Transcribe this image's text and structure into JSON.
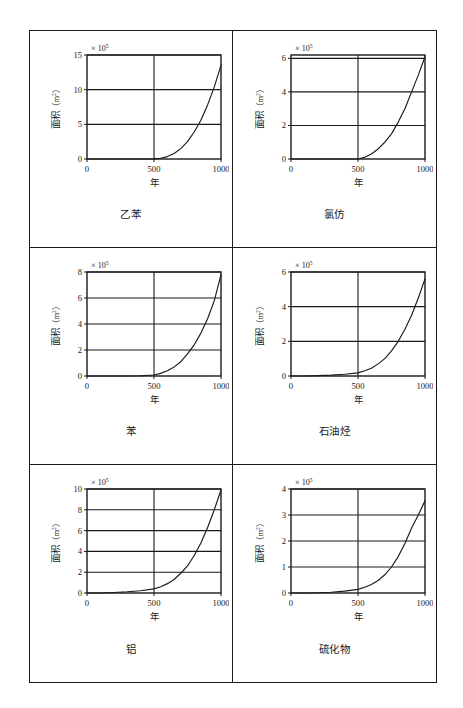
{
  "figure": {
    "layout": {
      "columns": 2,
      "rows": 3
    },
    "shared": {
      "x_axis_label": "年",
      "y_axis_label": "面积",
      "y_axis_unit_open": "（m",
      "y_axis_unit_sup": "2",
      "y_axis_unit_close": "）",
      "exponent_prefix": "× 10",
      "exponent_value": "5",
      "x_ticks": [
        "0",
        "500",
        "1000"
      ],
      "xlim": [
        0,
        1000
      ],
      "line_color": "#1a1a1a",
      "axis_color": "#1a1a1a",
      "grid_color": "#1a1a1a",
      "background": "#ffffff"
    }
  },
  "chart_data": [
    {
      "type": "line",
      "title": "乙苯",
      "xlabel": "年",
      "ylabel": "面积（m²）",
      "exponent": "× 10^5",
      "grid": true,
      "legend": null,
      "xlim": [
        0,
        1000
      ],
      "ylim": [
        0,
        15
      ],
      "x_ticks": [
        0,
        500,
        1000
      ],
      "y_ticks": [
        0,
        5,
        10,
        15
      ],
      "y_tick_labels": [
        "0",
        "5",
        "10",
        "15"
      ],
      "x": [
        0,
        100,
        200,
        300,
        400,
        500,
        550,
        600,
        650,
        700,
        750,
        800,
        850,
        900,
        950,
        1000
      ],
      "values": [
        0,
        0,
        0,
        0,
        0,
        0.02,
        0.1,
        0.35,
        0.8,
        1.5,
        2.5,
        3.9,
        5.6,
        7.8,
        10.4,
        13.5
      ]
    },
    {
      "type": "line",
      "title": "氯仿",
      "xlabel": "年",
      "ylabel": "面积（m²）",
      "exponent": "× 10^5",
      "grid": true,
      "legend": null,
      "xlim": [
        0,
        1000
      ],
      "ylim": [
        0,
        6.2
      ],
      "x_ticks": [
        0,
        500,
        1000
      ],
      "y_ticks": [
        0,
        2,
        4,
        6
      ],
      "y_tick_labels": [
        "0",
        "2",
        "4",
        "6"
      ],
      "x": [
        0,
        100,
        200,
        300,
        400,
        500,
        550,
        600,
        650,
        700,
        750,
        800,
        850,
        900,
        950,
        1000
      ],
      "values": [
        0,
        0,
        0,
        0,
        0,
        0.0,
        0.1,
        0.3,
        0.6,
        1.0,
        1.5,
        2.2,
        3.0,
        4.0,
        5.0,
        6.1
      ]
    },
    {
      "type": "line",
      "title": "苯",
      "xlabel": "年",
      "ylabel": "面积（m²）",
      "exponent": "× 10^5",
      "grid": true,
      "legend": null,
      "xlim": [
        0,
        1000
      ],
      "ylim": [
        0,
        8
      ],
      "x_ticks": [
        0,
        500,
        1000
      ],
      "y_ticks": [
        0,
        2,
        4,
        6,
        8
      ],
      "y_tick_labels": [
        "0",
        "2",
        "4",
        "6",
        "8"
      ],
      "x": [
        0,
        100,
        200,
        300,
        400,
        500,
        550,
        600,
        650,
        700,
        750,
        800,
        850,
        900,
        950,
        1000
      ],
      "values": [
        0,
        0,
        0,
        0,
        0.02,
        0.08,
        0.2,
        0.4,
        0.7,
        1.1,
        1.7,
        2.4,
        3.3,
        4.4,
        5.8,
        7.8
      ]
    },
    {
      "type": "line",
      "title": "石油烃",
      "xlabel": "年",
      "ylabel": "面积（m²）",
      "exponent": "× 10^5",
      "grid": true,
      "legend": null,
      "xlim": [
        0,
        1000
      ],
      "ylim": [
        0,
        6
      ],
      "x_ticks": [
        0,
        500,
        1000
      ],
      "y_ticks": [
        0,
        2,
        4,
        6
      ],
      "y_tick_labels": [
        "0",
        "2",
        "4",
        "6"
      ],
      "x": [
        0,
        100,
        200,
        300,
        400,
        500,
        550,
        600,
        650,
        700,
        750,
        800,
        850,
        900,
        950,
        1000
      ],
      "values": [
        0,
        0,
        0.02,
        0.05,
        0.1,
        0.18,
        0.3,
        0.45,
        0.7,
        1.0,
        1.45,
        2.0,
        2.7,
        3.5,
        4.5,
        5.6
      ]
    },
    {
      "type": "line",
      "title": "铝",
      "xlabel": "年",
      "ylabel": "面积（m²）",
      "exponent": "× 10^5",
      "grid": true,
      "legend": null,
      "xlim": [
        0,
        1000
      ],
      "ylim": [
        0,
        10
      ],
      "x_ticks": [
        0,
        500,
        1000
      ],
      "y_ticks": [
        0,
        2,
        4,
        6,
        8,
        10
      ],
      "y_tick_labels": [
        "0",
        "2",
        "4",
        "6",
        "8",
        "10"
      ],
      "x": [
        0,
        100,
        200,
        300,
        400,
        500,
        550,
        600,
        650,
        700,
        750,
        800,
        850,
        900,
        950,
        1000
      ],
      "values": [
        0,
        0,
        0.05,
        0.12,
        0.22,
        0.4,
        0.6,
        0.9,
        1.3,
        1.9,
        2.6,
        3.6,
        4.8,
        6.3,
        8.0,
        9.9
      ]
    },
    {
      "type": "line",
      "title": "硫化物",
      "xlabel": "年",
      "ylabel": "面积（m²）",
      "exponent": "× 10^5",
      "grid": true,
      "legend": null,
      "xlim": [
        0,
        1000
      ],
      "ylim": [
        0,
        4
      ],
      "x_ticks": [
        0,
        500,
        1000
      ],
      "y_ticks": [
        0,
        1,
        2,
        3,
        4
      ],
      "y_tick_labels": [
        "0",
        "1",
        "2",
        "3",
        "4"
      ],
      "x": [
        0,
        100,
        200,
        300,
        400,
        500,
        550,
        600,
        650,
        700,
        750,
        800,
        850,
        900,
        950,
        1000
      ],
      "values": [
        0,
        0,
        0.01,
        0.03,
        0.07,
        0.14,
        0.22,
        0.33,
        0.48,
        0.7,
        1.0,
        1.4,
        1.9,
        2.5,
        3.0,
        3.55
      ]
    }
  ]
}
